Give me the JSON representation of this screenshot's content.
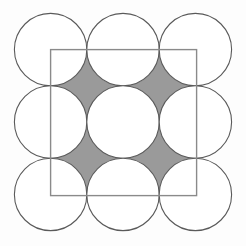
{
  "figure": {
    "title": "Nine tangent circles in a 3 by 3 packing with an inscribed tilted square and four shaded curved-star interstices",
    "type": "geometric-diagram",
    "canvas": {
      "width": 246,
      "height": 246,
      "background_color": "#fdfdfd"
    },
    "colors": {
      "background": "#fdfdfd",
      "circle_stroke": "#5a5a5a",
      "circle_fill": "#ffffff",
      "square_stroke": "#8a8a8a",
      "square_fill": "none",
      "interstice_fill": "#9a9a9a",
      "interstice_stroke": "#5a5a5a"
    },
    "strokes": {
      "circle_stroke_width": 1.1,
      "square_stroke_width": 1.4,
      "interstice_stroke_width": 1.0
    },
    "circles": {
      "count": 9,
      "rows": 3,
      "columns": 3,
      "radius": 36.2,
      "diameter": 72.4,
      "center_spacing": 72.4,
      "grid_origin_x": 50.6,
      "grid_origin_y": 49.6,
      "bounding_box": {
        "left": 14.4,
        "top": 13.4,
        "right": 231.6,
        "bottom": 230.6
      },
      "centers": [
        {
          "label": "circle-top-left",
          "cx": 50.6,
          "cy": 49.6
        },
        {
          "label": "circle-top-center",
          "cx": 123.0,
          "cy": 49.6
        },
        {
          "label": "circle-top-right",
          "cx": 195.4,
          "cy": 49.6
        },
        {
          "label": "circle-middle-left",
          "cx": 50.6,
          "cy": 122.0
        },
        {
          "label": "circle-middle-center",
          "cx": 123.0,
          "cy": 122.0
        },
        {
          "label": "circle-middle-right",
          "cx": 195.4,
          "cy": 122.0
        },
        {
          "label": "circle-bottom-left",
          "cx": 50.6,
          "cy": 194.4
        },
        {
          "label": "circle-bottom-center",
          "cx": 123.0,
          "cy": 194.4
        },
        {
          "label": "circle-bottom-right",
          "cx": 195.4,
          "cy": 194.4
        }
      ]
    },
    "square": {
      "label": "overlay-square",
      "x": 50.6,
      "y": 49.6,
      "side": 146.0,
      "corners": [
        {
          "label": "corner-top-left",
          "x": 50.6,
          "y": 49.6
        },
        {
          "label": "corner-top-right",
          "x": 196.6,
          "y": 49.6
        },
        {
          "label": "corner-bottom-right",
          "x": 196.6,
          "y": 195.6
        },
        {
          "label": "corner-bottom-left",
          "x": 50.6,
          "y": 195.6
        }
      ]
    },
    "interstices": {
      "count": 4,
      "shape": "curved-sided star (astroid-like region between four mutually tangent circles)",
      "half_diagonal": 36.2,
      "centers": [
        {
          "label": "interstice-top-left",
          "cx": 86.8,
          "cy": 85.8
        },
        {
          "label": "interstice-top-right",
          "cx": 159.2,
          "cy": 85.8
        },
        {
          "label": "interstice-bottom-left",
          "cx": 86.8,
          "cy": 158.2
        },
        {
          "label": "interstice-bottom-right",
          "cx": 159.2,
          "cy": 158.2
        }
      ]
    },
    "tangent_points": {
      "description": "Adjacent circles touch at midpoints of the connecting center lines",
      "spacing": 72.4
    }
  }
}
